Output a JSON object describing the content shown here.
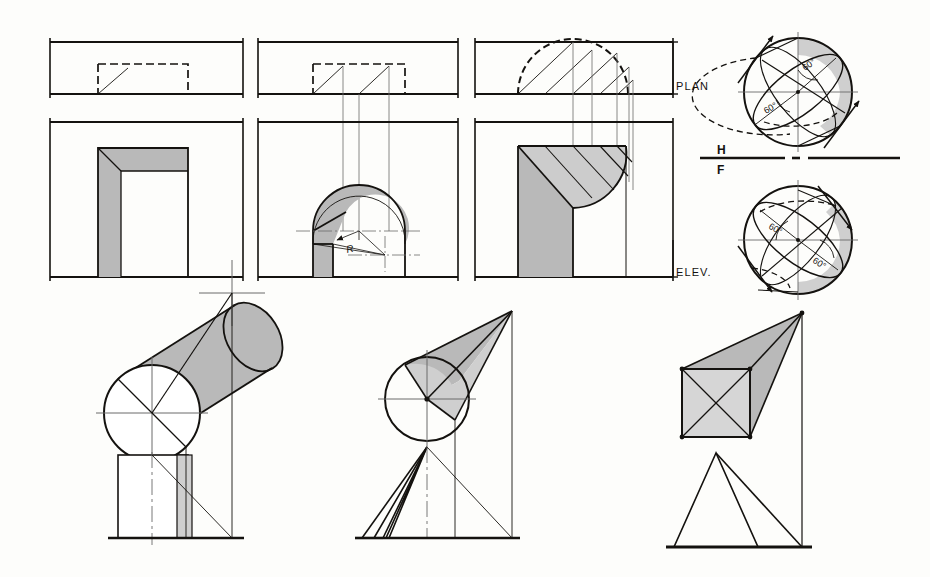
{
  "plate": {
    "title": "Shadows of openings and solids — plan and elevation construction",
    "background_color": "#fdfdfb",
    "ink_color": "#14120f",
    "shade_color": "#b9b9b9",
    "light_shade_color": "#cfcfcf",
    "thin_line_color": "#6a6a6a"
  },
  "labels": {
    "plan": "PLAN",
    "elev": "ELEV.",
    "horizontal": "H",
    "frontal": "F",
    "radius": "R",
    "angle": "60°"
  },
  "panels": [
    {
      "id": "panel-rect-opening",
      "name": "Rectangular opening",
      "plan": {
        "x": 50,
        "y": 42,
        "w": 193,
        "h": 52
      },
      "elev": {
        "x": 50,
        "y": 122,
        "w": 193,
        "h": 155
      },
      "opening": {
        "x": 98,
        "y": 148,
        "w": 90,
        "h": 129
      },
      "shadow_type": "reveal-and-head"
    },
    {
      "id": "panel-arched-opening",
      "name": "Semicircular arched opening",
      "plan": {
        "x": 258,
        "y": 42,
        "w": 200,
        "h": 52
      },
      "elev": {
        "x": 258,
        "y": 122,
        "w": 200,
        "h": 155
      },
      "opening": {
        "x": 313,
        "y": 185,
        "w": 92,
        "h": 92
      },
      "arch_radius": 46,
      "shadow_type": "arch-reveal",
      "radius_label": "R"
    },
    {
      "id": "panel-quarter-round",
      "name": "Quarter-round niche opening",
      "plan": {
        "x": 475,
        "y": 42,
        "w": 198,
        "h": 52
      },
      "elev": {
        "x": 475,
        "y": 122,
        "w": 198,
        "h": 155
      },
      "opening": {
        "x": 518,
        "y": 146,
        "w": 108,
        "h": 131
      },
      "shadow_type": "hatched-quarter-round"
    }
  ],
  "spheres": [
    {
      "id": "sphere-plan",
      "name": "Sphere shadow — plan view",
      "cx": 798,
      "cy": 92,
      "r": 54,
      "angles": [
        "60°",
        "60°"
      ]
    },
    {
      "id": "sphere-elev",
      "name": "Sphere shadow — elevation view",
      "cx": 798,
      "cy": 240,
      "r": 54,
      "angles": [
        "60°",
        "60°"
      ]
    }
  ],
  "fold_line": {
    "name": "H-F folding line",
    "x1": 700,
    "x2": 900,
    "y": 158,
    "above": "H",
    "below": "F"
  },
  "solids": [
    {
      "id": "solid-cylinder",
      "name": "Inclined cylinder casting shadow",
      "circle": {
        "cx": 152,
        "cy": 413,
        "r": 48
      },
      "ground_y": 538,
      "base_box": {
        "x": 118,
        "y": 455,
        "w": 70,
        "h": 83
      }
    },
    {
      "id": "solid-cone",
      "name": "Inclined cone casting shadow",
      "circle": {
        "cx": 427,
        "cy": 399,
        "r": 42
      },
      "apex": {
        "x": 512,
        "y": 311
      },
      "ground_y": 538
    },
    {
      "id": "solid-prism",
      "name": "Square prism casting shadow",
      "square": {
        "x": 682,
        "y": 369,
        "w": 68,
        "h": 68
      },
      "apex": {
        "x": 802,
        "y": 313
      },
      "ground_y": 547
    }
  ]
}
